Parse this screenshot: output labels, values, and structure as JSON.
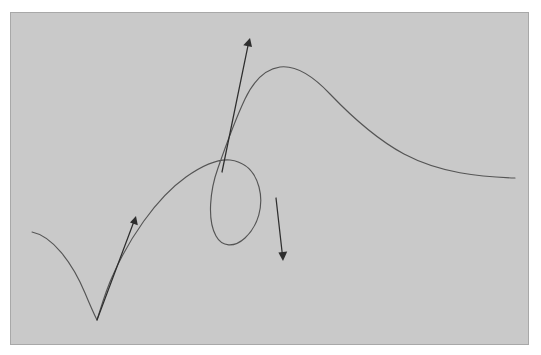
{
  "canvas": {
    "width": 541,
    "height": 355,
    "background_color": "#ffffff"
  },
  "panel": {
    "label": "figure-panel",
    "x": 10,
    "y": 12,
    "width": 519,
    "height": 333,
    "fill_color": "#c9c9c9",
    "border_color": "#a8a8a8",
    "border_width": 1
  },
  "figure": {
    "title": "",
    "stroke_color": "#555555",
    "stroke_width": 1.15,
    "arrow_color": "#2e2e2e",
    "arrow_width": 1.25
  },
  "chart_data": {
    "type": "line",
    "title": "",
    "xlabel": "",
    "ylabel": "",
    "grid": false,
    "legend": "none",
    "xlim": [
      10,
      529
    ],
    "ylim": [
      12,
      345
    ],
    "series": [
      {
        "name": "parametric-curve",
        "color": "#555555",
        "comment": "Single continuous stroke: left tail down to cusp, up through arch, over loop crossing, up to apex, then long descent to the right edge.",
        "path": "M 32 232 C 52 236 72 262 85 293 C 90 305 94 314 97 320 C 100 311 105 292 113 275 C 128 241 155 199 186 177 C 203 165 219 159 230 160 C 245 162 255 172 259 187 C 264 206 258 226 245 238 C 234 248 222 247 216 236 C 207 220 210 190 218 168 C 225 148 236 118 245 99 C 254 80 266 69 280 67 C 296 65 313 76 330 94 C 352 117 378 140 404 154 C 440 173 480 177 515 178"
      }
    ],
    "arrows": [
      {
        "name": "tangent-arrow-left",
        "label": "",
        "from": [
          97,
          320
        ],
        "to": [
          136,
          216
        ],
        "color": "#2e2e2e",
        "head_size": 7
      },
      {
        "name": "tangent-arrow-up",
        "label": "",
        "from": [
          222,
          172
        ],
        "to": [
          250,
          38
        ],
        "color": "#2e2e2e",
        "head_size": 8
      },
      {
        "name": "tangent-arrow-down",
        "label": "",
        "from": [
          276,
          198
        ],
        "to": [
          283,
          261
        ],
        "color": "#2e2e2e",
        "head_size": 7
      }
    ],
    "key_points": [
      {
        "name": "curve-start-left",
        "x": 32,
        "y": 232
      },
      {
        "name": "cusp",
        "x": 97,
        "y": 320
      },
      {
        "name": "loop-crossing",
        "x": 226,
        "y": 161
      },
      {
        "name": "loop-rightmost",
        "x": 262,
        "y": 200
      },
      {
        "name": "loop-bottom",
        "x": 243,
        "y": 240
      },
      {
        "name": "apex",
        "x": 280,
        "y": 67
      },
      {
        "name": "curve-end-right",
        "x": 515,
        "y": 178
      }
    ]
  }
}
